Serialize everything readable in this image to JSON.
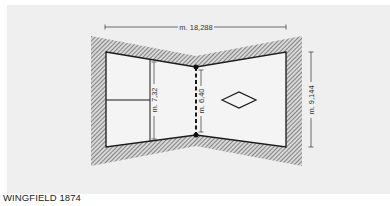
{
  "figure": {
    "caption": "WINGFIELD 1874",
    "dimensions": {
      "length": "m. 18,288",
      "width_baseline": "m. 9,144",
      "width_service": "m. 7,32",
      "width_net": "m. 6,40"
    },
    "elements": [
      {
        "id": "court-outline",
        "label": "court boundary (hourglass)"
      },
      {
        "id": "net",
        "label": "net (dashed line with posts)"
      },
      {
        "id": "service-line",
        "label": "service line"
      },
      {
        "id": "center-service-line",
        "label": "centre service line"
      },
      {
        "id": "diamond",
        "label": "diamond marking in opposite court"
      },
      {
        "id": "surround",
        "label": "hatched surround"
      }
    ],
    "colors": {
      "panel_bg": "#efefef",
      "court_fill": "#f4f4f4",
      "line": "#1a1a1a",
      "hatch": "#555555"
    }
  }
}
